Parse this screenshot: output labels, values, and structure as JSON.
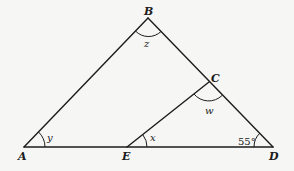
{
  "diagram": {
    "type": "geometry-triangle",
    "vertices": {
      "A": {
        "label": "A",
        "x": 24,
        "y": 147
      },
      "B": {
        "label": "B",
        "x": 148,
        "y": 18
      },
      "C": {
        "label": "C",
        "x": 209,
        "y": 82
      },
      "D": {
        "label": "D",
        "x": 273,
        "y": 147
      },
      "E": {
        "label": "E",
        "x": 127,
        "y": 147
      }
    },
    "segments": [
      "AB",
      "BD",
      "AD",
      "EC"
    ],
    "angles": {
      "y": {
        "label": "y",
        "at": "A"
      },
      "z": {
        "label": "z",
        "at": "B"
      },
      "w": {
        "label": "w",
        "at": "C"
      },
      "x": {
        "label": "x",
        "at": "E"
      },
      "D": {
        "label": "55°",
        "at": "D"
      }
    },
    "colors": {
      "line": "#1c1c1c",
      "background": "#f6f6f4"
    }
  }
}
